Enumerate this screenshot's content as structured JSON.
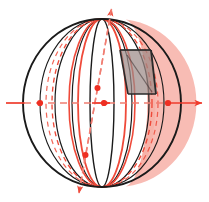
{
  "figure": {
    "canvas": {
      "width": 209,
      "height": 202,
      "background": "#ffffff"
    }
  },
  "colors": {
    "outline": "#1a1a1a",
    "meridian": "#1a1a1a",
    "axis_red": "#ef3b2c",
    "axis_red_dashed": "#f07d72",
    "cap_fill": "#f6a99f",
    "cap_edge": "#ef4a3a",
    "cap_dashed": "#ef4a3a",
    "quad_fill": "#9c8a88",
    "quad_edge": "#2a2a2a",
    "dot_red": "#ee2f22"
  },
  "sphere": {
    "name": "sphere-outline",
    "center": {
      "x": 102,
      "y": 103
    },
    "radius_x": 79,
    "radius_y": 84,
    "stroke_width": 1.9
  },
  "meridians": [
    {
      "name": "meridian-1",
      "rx": 12,
      "stroke_width": 1.4
    },
    {
      "name": "meridian-2",
      "rx": 30,
      "stroke_width": 1.2
    },
    {
      "name": "meridian-3",
      "rx": 47,
      "stroke_width": 1.2
    },
    {
      "name": "meridian-4",
      "rx": 62,
      "stroke_width": 1.1
    }
  ],
  "cap_region": {
    "name": "shaded-cap-region",
    "description": "Translucent red lens/cap bounded by two solid red ellipse arcs on the left and the sphere outline on the right",
    "left_arc_rx": 24,
    "left_arc_inner_rx": 33,
    "dashed_arc_rx": 56,
    "dashed_arc_2_rx": 50,
    "cap_left_x": 126,
    "fill_opacity": 0.62
  },
  "quadrilateral": {
    "name": "inscribed-quadrilateral",
    "description": "Gray translucent parallelogram-like cross-section inside the cap",
    "points": "120,50 151,50 156,94 128,94",
    "fill_opacity": 0.72
  },
  "horizontal_axis": {
    "name": "horizontal-axis",
    "y": 103,
    "x_start": 6,
    "x_end": 203,
    "style": "dashed-inside-solid-outside",
    "arrow_label": "arrow-right",
    "dots": [
      {
        "name": "axis-dot-left",
        "x": 40,
        "y": 103,
        "r": 3.1
      },
      {
        "name": "axis-dot-center",
        "x": 104,
        "y": 103,
        "r": 3.1
      },
      {
        "name": "axis-dot-right",
        "x": 168,
        "y": 103,
        "r": 3.1
      }
    ]
  },
  "diagonal_axis": {
    "name": "diagonal-axis",
    "x_start": 78,
    "y_start": 196,
    "x_end": 112,
    "y_end": 6,
    "style": "dashed",
    "arrows": [
      "arrow-up-right",
      "arrow-down-left"
    ],
    "dots": [
      {
        "name": "diagonal-dot-upper",
        "x": 97.5,
        "y": 88,
        "r": 3.0
      },
      {
        "name": "diagonal-dot-lower",
        "x": 85.5,
        "y": 155,
        "r": 3.0
      }
    ]
  }
}
